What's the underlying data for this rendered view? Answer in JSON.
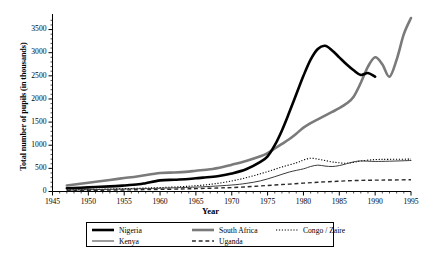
{
  "chart_data": {
    "type": "line",
    "title": "",
    "xlabel": "Year",
    "ylabel": "Total number of pupils (in thousands)",
    "xlim": [
      1945,
      1995
    ],
    "ylim": [
      0,
      3750
    ],
    "xticks": [
      1945,
      1950,
      1955,
      1960,
      1965,
      1970,
      1975,
      1980,
      1985,
      1990,
      1995
    ],
    "yticks": [
      0,
      500,
      1000,
      1500,
      2000,
      2500,
      3000,
      3500
    ],
    "minor_xtick_interval": 1,
    "minor_ytick_interval": 100,
    "grid": false,
    "legend_position": "bottom",
    "series": [
      {
        "name": "Nigeria",
        "style": "solid",
        "color": "#000000",
        "width": 2.6,
        "points": [
          [
            1947,
            70
          ],
          [
            1950,
            90
          ],
          [
            1953,
            110
          ],
          [
            1955,
            130
          ],
          [
            1957,
            155
          ],
          [
            1958,
            180
          ],
          [
            1960,
            240
          ],
          [
            1962,
            255
          ],
          [
            1964,
            270
          ],
          [
            1965,
            285
          ],
          [
            1966,
            300
          ],
          [
            1968,
            330
          ],
          [
            1970,
            390
          ],
          [
            1972,
            480
          ],
          [
            1974,
            640
          ],
          [
            1975,
            760
          ],
          [
            1976,
            1000
          ],
          [
            1977,
            1320
          ],
          [
            1978,
            1700
          ],
          [
            1979,
            2100
          ],
          [
            1980,
            2500
          ],
          [
            1981,
            2850
          ],
          [
            1982,
            3080
          ],
          [
            1983,
            3150
          ],
          [
            1984,
            3050
          ],
          [
            1985,
            2900
          ],
          [
            1986,
            2750
          ],
          [
            1987,
            2620
          ],
          [
            1988,
            2520
          ],
          [
            1989,
            2560
          ],
          [
            1990,
            2480
          ]
        ]
      },
      {
        "name": "South Africa",
        "style": "solid",
        "color": "#7a7a7a",
        "width": 2.6,
        "points": [
          [
            1947,
            130
          ],
          [
            1950,
            190
          ],
          [
            1953,
            250
          ],
          [
            1955,
            290
          ],
          [
            1957,
            330
          ],
          [
            1960,
            400
          ],
          [
            1962,
            410
          ],
          [
            1964,
            430
          ],
          [
            1965,
            450
          ],
          [
            1967,
            480
          ],
          [
            1969,
            540
          ],
          [
            1970,
            580
          ],
          [
            1972,
            660
          ],
          [
            1974,
            760
          ],
          [
            1975,
            830
          ],
          [
            1976,
            930
          ],
          [
            1977,
            1030
          ],
          [
            1978,
            1130
          ],
          [
            1979,
            1250
          ],
          [
            1980,
            1380
          ],
          [
            1981,
            1480
          ],
          [
            1982,
            1560
          ],
          [
            1983,
            1640
          ],
          [
            1984,
            1720
          ],
          [
            1985,
            1800
          ],
          [
            1986,
            1900
          ],
          [
            1987,
            2050
          ],
          [
            1988,
            2350
          ],
          [
            1989,
            2700
          ],
          [
            1990,
            2900
          ],
          [
            1991,
            2750
          ],
          [
            1992,
            2480
          ],
          [
            1993,
            2850
          ],
          [
            1994,
            3400
          ],
          [
            1995,
            3750
          ]
        ]
      },
      {
        "name": "Kenya",
        "style": "solid",
        "color": "#3a3a3a",
        "width": 1.0,
        "points": [
          [
            1947,
            30
          ],
          [
            1952,
            45
          ],
          [
            1957,
            60
          ],
          [
            1960,
            70
          ],
          [
            1963,
            85
          ],
          [
            1965,
            95
          ],
          [
            1967,
            110
          ],
          [
            1970,
            140
          ],
          [
            1972,
            175
          ],
          [
            1974,
            230
          ],
          [
            1976,
            320
          ],
          [
            1978,
            420
          ],
          [
            1980,
            490
          ],
          [
            1981,
            540
          ],
          [
            1982,
            570
          ],
          [
            1983,
            550
          ],
          [
            1984,
            540
          ],
          [
            1985,
            560
          ],
          [
            1986,
            600
          ],
          [
            1987,
            640
          ],
          [
            1988,
            660
          ],
          [
            1990,
            650
          ],
          [
            1992,
            655
          ],
          [
            1995,
            670
          ]
        ]
      },
      {
        "name": "Congo / Zaire",
        "style": "dotted",
        "color": "#000000",
        "width": 1.1,
        "points": [
          [
            1947,
            35
          ],
          [
            1952,
            50
          ],
          [
            1957,
            70
          ],
          [
            1960,
            85
          ],
          [
            1963,
            105
          ],
          [
            1965,
            125
          ],
          [
            1967,
            155
          ],
          [
            1969,
            200
          ],
          [
            1971,
            260
          ],
          [
            1973,
            340
          ],
          [
            1975,
            430
          ],
          [
            1977,
            530
          ],
          [
            1979,
            620
          ],
          [
            1980,
            680
          ],
          [
            1981,
            720
          ],
          [
            1982,
            700
          ],
          [
            1983,
            670
          ],
          [
            1984,
            640
          ],
          [
            1985,
            620
          ],
          [
            1986,
            610
          ],
          [
            1987,
            630
          ],
          [
            1988,
            660
          ],
          [
            1990,
            690
          ],
          [
            1992,
            695
          ],
          [
            1995,
            700
          ]
        ]
      },
      {
        "name": "Uganda",
        "style": "dashed",
        "color": "#2a2a2a",
        "width": 1.4,
        "points": [
          [
            1947,
            20
          ],
          [
            1952,
            28
          ],
          [
            1957,
            38
          ],
          [
            1960,
            45
          ],
          [
            1963,
            55
          ],
          [
            1965,
            62
          ],
          [
            1968,
            75
          ],
          [
            1970,
            85
          ],
          [
            1972,
            100
          ],
          [
            1974,
            120
          ],
          [
            1976,
            140
          ],
          [
            1978,
            160
          ],
          [
            1980,
            180
          ],
          [
            1982,
            200
          ],
          [
            1984,
            215
          ],
          [
            1986,
            230
          ],
          [
            1988,
            240
          ],
          [
            1990,
            245
          ],
          [
            1992,
            248
          ],
          [
            1995,
            255
          ]
        ]
      }
    ]
  },
  "axis": {
    "ylabel": "Total number of pupils (in thousands)",
    "xlabel": "Year",
    "ytick_labels": [
      "0",
      "500",
      "1000",
      "1500",
      "2000",
      "2500",
      "3000",
      "3500"
    ],
    "xtick_labels": [
      "1945",
      "1950",
      "1955",
      "1960",
      "1965",
      "1970",
      "1975",
      "1980",
      "1985",
      "1990",
      "1995"
    ]
  },
  "legend": {
    "items": [
      {
        "label": "Nigeria",
        "style": "solid-thick",
        "color": "#000000"
      },
      {
        "label": "Kenya",
        "style": "solid-thin",
        "color": "#3a3a3a"
      },
      {
        "label": "South Africa",
        "style": "solid-thick",
        "color": "#7a7a7a"
      },
      {
        "label": "Uganda",
        "style": "dashed",
        "color": "#2a2a2a"
      },
      {
        "label": "Congo / Zaire",
        "style": "dotted",
        "color": "#000000"
      }
    ]
  }
}
